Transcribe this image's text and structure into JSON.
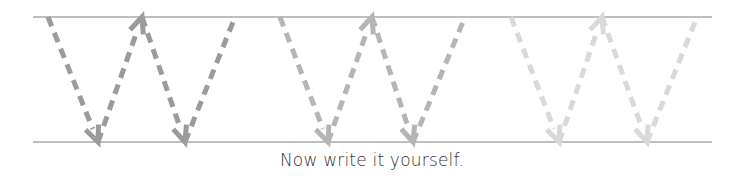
{
  "worksheet": {
    "letter": "W",
    "instruction": "Now write it yourself.",
    "guide_lines": {
      "color": "#a8a8a8",
      "x_start": 33,
      "x_end": 712,
      "top_y": 17,
      "bottom_y": 142
    },
    "letters": [
      {
        "color": "#9b9b9b",
        "points": [
          [
            48,
            17
          ],
          [
            98,
            142
          ],
          [
            142,
            17
          ],
          [
            185,
            142
          ],
          [
            235,
            17
          ]
        ]
      },
      {
        "color": "#b5b5b5",
        "points": [
          [
            280,
            17
          ],
          [
            328,
            142
          ],
          [
            372,
            17
          ],
          [
            413,
            142
          ],
          [
            465,
            17
          ]
        ]
      },
      {
        "color": "#d9d9d9",
        "points": [
          [
            511,
            17
          ],
          [
            559,
            142
          ],
          [
            602,
            17
          ],
          [
            647,
            142
          ],
          [
            697,
            17
          ]
        ]
      }
    ],
    "icons": {
      "arrowhead_down": "arrowhead-down-icon",
      "arrowhead_up": "arrowhead-up-icon"
    }
  }
}
